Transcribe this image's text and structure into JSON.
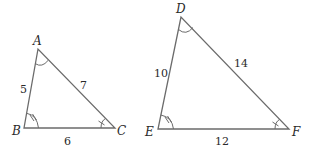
{
  "diagram": {
    "type": "similar-triangles",
    "triangles": [
      {
        "name": "ABC",
        "vertices": [
          {
            "label": "A",
            "x": 38,
            "y": 49
          },
          {
            "label": "B",
            "x": 24,
            "y": 128
          },
          {
            "label": "C",
            "x": 115,
            "y": 128
          }
        ],
        "sides": [
          {
            "between": "AB",
            "label": "5"
          },
          {
            "between": "AC",
            "label": "7"
          },
          {
            "between": "BC",
            "label": "6"
          }
        ],
        "angle_marks": [
          {
            "vertex": "A",
            "style": "single-arc"
          },
          {
            "vertex": "B",
            "style": "arc-double-tick"
          },
          {
            "vertex": "C",
            "style": "arc-single-tick"
          }
        ]
      },
      {
        "name": "DEF",
        "vertices": [
          {
            "label": "D",
            "x": 181,
            "y": 17
          },
          {
            "label": "E",
            "x": 158,
            "y": 129
          },
          {
            "label": "F",
            "x": 289,
            "y": 129
          }
        ],
        "sides": [
          {
            "between": "DE",
            "label": "10"
          },
          {
            "between": "DF",
            "label": "14"
          },
          {
            "between": "EF",
            "label": "12"
          }
        ],
        "angle_marks": [
          {
            "vertex": "D",
            "style": "single-arc"
          },
          {
            "vertex": "E",
            "style": "arc-double-tick"
          },
          {
            "vertex": "F",
            "style": "arc-single-tick"
          }
        ]
      }
    ]
  }
}
